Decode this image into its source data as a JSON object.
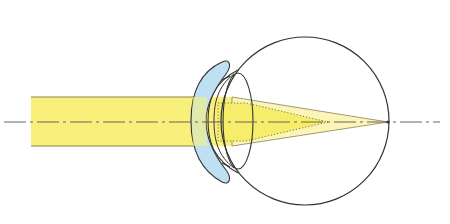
{
  "diagram": {
    "title": "",
    "colors": {
      "background": "#ffffff",
      "beam_fill": "#f8f07a",
      "beam_edge": "#8a8250",
      "cone_fill": "#fbf5b8",
      "inner_cone_fill": "#f6ee6a",
      "contact_lens_fill": "#bfe0f2",
      "outline": "#333333",
      "axis": "#555555"
    },
    "labels": []
  }
}
